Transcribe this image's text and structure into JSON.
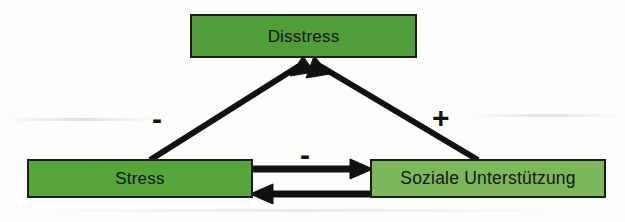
{
  "diagram": {
    "type": "path-model",
    "nodes": [
      {
        "id": "disstress",
        "label": "Disstress",
        "fill": "#4f9e37"
      },
      {
        "id": "stress",
        "label": "Stress",
        "fill": "#56a63a"
      },
      {
        "id": "support",
        "label": "Soziale Unterstützung",
        "fill": "#7cb85a"
      }
    ],
    "edges": [
      {
        "id": "stress-to-disstress",
        "from": "stress",
        "to": "disstress",
        "sign": "-",
        "style": "diagonal-arrow"
      },
      {
        "id": "support-to-disstress",
        "from": "support",
        "to": "disstress",
        "sign": "+",
        "style": "diagonal-arrow"
      },
      {
        "id": "stress-to-support",
        "from": "stress",
        "to": "support",
        "sign": "-",
        "style": "horizontal-arrow"
      },
      {
        "id": "support-to-stress",
        "from": "support",
        "to": "stress",
        "sign": "",
        "style": "horizontal-arrow"
      }
    ],
    "colors": {
      "background": "#fdfdfb",
      "border": "#1c1c1c",
      "arrow": "#111111",
      "text": "#141414"
    }
  }
}
